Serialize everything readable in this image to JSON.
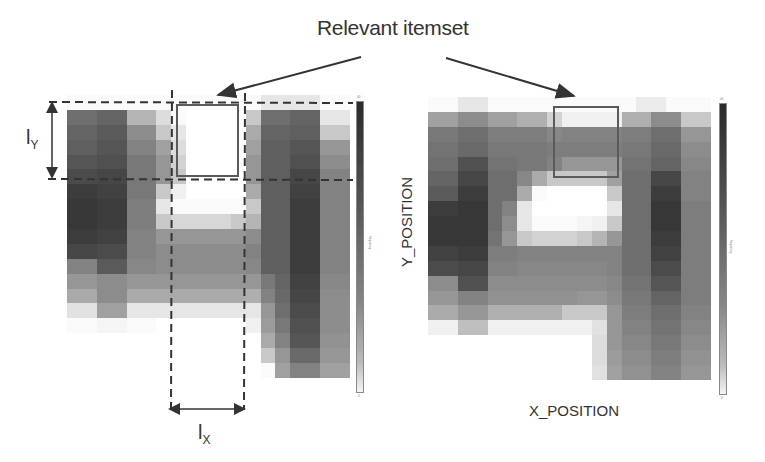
{
  "title": "Relevant itemset",
  "left_panel": {
    "ly_label": "l",
    "ly_sub": "Y",
    "lx_label": "l",
    "lx_sub": "X",
    "colorbar": {
      "top_tick": "40",
      "bottom_tick": "0",
      "label": "frequency"
    }
  },
  "right_panel": {
    "x_axis_label": "X_POSITION",
    "y_axis_label": "Y_POSITION",
    "colorbar": {
      "top_tick": "40",
      "bottom_tick": "0",
      "label": "frequency"
    }
  },
  "colors": {
    "box_border": "#5a5a5a",
    "dash": "#333333",
    "arrow": "#333333"
  },
  "chart_data": [
    {
      "type": "heatmap",
      "title": "Left heatmap with itemset window",
      "xlabel": "",
      "ylabel": "",
      "legend": "grayscale colorbar (dark = high frequency, light = low)",
      "origin": [
        67,
        95
      ],
      "cell_w": 14.9,
      "cell_h": 14.9,
      "grid": [
        [
          250,
          250,
          250,
          250,
          250,
          250,
          250,
          250,
          250,
          250,
          250,
          250,
          250,
          230,
          230,
          230,
          230,
          250,
          250
        ],
        [
          110,
          110,
          100,
          100,
          180,
          180,
          220,
          250,
          255,
          255,
          255,
          255,
          200,
          110,
          110,
          100,
          100,
          230,
          230
        ],
        [
          100,
          100,
          90,
          90,
          140,
          140,
          200,
          230,
          255,
          255,
          255,
          255,
          170,
          100,
          100,
          95,
          95,
          200,
          200
        ],
        [
          95,
          95,
          85,
          85,
          130,
          130,
          160,
          220,
          255,
          255,
          255,
          255,
          160,
          95,
          95,
          85,
          85,
          150,
          150
        ],
        [
          85,
          85,
          80,
          80,
          120,
          120,
          150,
          210,
          255,
          255,
          255,
          255,
          150,
          95,
          95,
          80,
          80,
          140,
          140
        ],
        [
          75,
          75,
          70,
          70,
          120,
          120,
          150,
          200,
          255,
          255,
          255,
          255,
          150,
          95,
          95,
          70,
          70,
          130,
          130
        ],
        [
          60,
          60,
          65,
          65,
          120,
          120,
          200,
          240,
          255,
          255,
          255,
          255,
          170,
          95,
          95,
          65,
          65,
          130,
          130
        ],
        [
          55,
          55,
          60,
          60,
          125,
          125,
          230,
          250,
          250,
          250,
          250,
          250,
          200,
          95,
          95,
          60,
          60,
          130,
          130
        ],
        [
          55,
          55,
          60,
          60,
          125,
          125,
          200,
          215,
          215,
          215,
          215,
          200,
          180,
          95,
          95,
          60,
          60,
          130,
          130
        ],
        [
          60,
          60,
          65,
          65,
          130,
          130,
          150,
          150,
          150,
          150,
          150,
          150,
          140,
          95,
          95,
          60,
          60,
          130,
          130
        ],
        [
          70,
          70,
          75,
          75,
          130,
          130,
          140,
          140,
          140,
          140,
          140,
          140,
          130,
          95,
          95,
          60,
          60,
          130,
          130
        ],
        [
          130,
          130,
          90,
          90,
          135,
          135,
          140,
          140,
          140,
          140,
          140,
          140,
          135,
          95,
          95,
          60,
          60,
          130,
          130
        ],
        [
          150,
          150,
          140,
          140,
          150,
          150,
          150,
          150,
          150,
          150,
          150,
          150,
          150,
          120,
          100,
          65,
          65,
          135,
          135
        ],
        [
          170,
          170,
          140,
          140,
          170,
          170,
          170,
          170,
          170,
          170,
          170,
          170,
          175,
          130,
          105,
          70,
          70,
          140,
          140
        ],
        [
          225,
          225,
          160,
          160,
          230,
          230,
          230,
          230,
          230,
          230,
          230,
          230,
          230,
          150,
          110,
          75,
          75,
          140,
          140
        ],
        [
          250,
          250,
          245,
          245,
          250,
          250,
          255,
          255,
          255,
          255,
          255,
          255,
          240,
          155,
          120,
          80,
          80,
          140,
          140
        ],
        [
          255,
          255,
          255,
          255,
          255,
          255,
          255,
          255,
          255,
          255,
          255,
          255,
          255,
          170,
          130,
          85,
          85,
          145,
          145
        ],
        [
          255,
          255,
          255,
          255,
          255,
          255,
          255,
          255,
          255,
          255,
          255,
          255,
          255,
          200,
          150,
          105,
          105,
          150,
          150
        ],
        [
          255,
          255,
          255,
          255,
          255,
          255,
          255,
          255,
          255,
          255,
          255,
          255,
          255,
          250,
          160,
          130,
          130,
          160,
          160
        ],
        [
          255,
          255,
          255,
          255,
          255,
          255,
          255,
          255,
          255,
          255,
          255,
          255,
          255,
          255,
          255,
          255,
          255,
          255,
          255
        ]
      ]
    },
    {
      "type": "heatmap",
      "title": "Right heatmap",
      "xlabel": "X_POSITION",
      "ylabel": "Y_POSITION",
      "legend": "grayscale colorbar (dark = high frequency, light = low)",
      "origin": [
        428,
        97
      ],
      "cell_w": 14.9,
      "cell_h": 14.9,
      "grid": [
        [
          250,
          250,
          230,
          230,
          250,
          250,
          250,
          250,
          250,
          250,
          250,
          250,
          250,
          250,
          235,
          235,
          250,
          250,
          250
        ],
        [
          160,
          160,
          140,
          140,
          160,
          160,
          175,
          175,
          210,
          240,
          240,
          240,
          240,
          175,
          175,
          140,
          140,
          200,
          200
        ],
        [
          120,
          120,
          110,
          110,
          125,
          125,
          125,
          125,
          135,
          130,
          130,
          130,
          130,
          125,
          125,
          110,
          110,
          150,
          150
        ],
        [
          115,
          115,
          105,
          105,
          120,
          120,
          120,
          120,
          125,
          125,
          125,
          125,
          125,
          120,
          120,
          105,
          105,
          140,
          140
        ],
        [
          110,
          110,
          80,
          80,
          115,
          115,
          120,
          120,
          130,
          150,
          150,
          150,
          150,
          115,
          115,
          100,
          100,
          135,
          135
        ],
        [
          100,
          100,
          70,
          70,
          110,
          110,
          135,
          170,
          200,
          200,
          200,
          200,
          160,
          110,
          110,
          70,
          70,
          130,
          130
        ],
        [
          90,
          90,
          60,
          60,
          110,
          110,
          170,
          250,
          255,
          255,
          255,
          255,
          200,
          110,
          110,
          60,
          60,
          130,
          130
        ],
        [
          60,
          60,
          55,
          55,
          110,
          130,
          230,
          255,
          255,
          255,
          255,
          255,
          230,
          110,
          110,
          55,
          55,
          125,
          125
        ],
        [
          55,
          55,
          55,
          55,
          110,
          140,
          230,
          250,
          250,
          250,
          245,
          240,
          200,
          110,
          110,
          55,
          55,
          125,
          125
        ],
        [
          55,
          55,
          55,
          55,
          115,
          150,
          200,
          210,
          210,
          210,
          200,
          180,
          150,
          110,
          110,
          60,
          60,
          125,
          125
        ],
        [
          65,
          65,
          60,
          60,
          125,
          125,
          130,
          130,
          130,
          130,
          130,
          130,
          130,
          110,
          110,
          65,
          65,
          125,
          125
        ],
        [
          75,
          75,
          70,
          70,
          130,
          130,
          135,
          135,
          135,
          135,
          135,
          135,
          130,
          110,
          110,
          75,
          75,
          125,
          125
        ],
        [
          140,
          140,
          80,
          80,
          140,
          140,
          140,
          140,
          140,
          140,
          140,
          140,
          135,
          115,
          115,
          85,
          85,
          125,
          125
        ],
        [
          150,
          150,
          130,
          130,
          145,
          145,
          145,
          145,
          145,
          145,
          150,
          150,
          140,
          120,
          120,
          100,
          100,
          125,
          125
        ],
        [
          170,
          170,
          150,
          150,
          175,
          175,
          175,
          175,
          175,
          200,
          200,
          200,
          150,
          125,
          125,
          110,
          110,
          130,
          130
        ],
        [
          240,
          240,
          190,
          190,
          240,
          240,
          240,
          240,
          240,
          240,
          240,
          225,
          150,
          130,
          130,
          115,
          115,
          135,
          135
        ],
        [
          255,
          255,
          255,
          255,
          255,
          255,
          255,
          255,
          255,
          255,
          255,
          220,
          150,
          135,
          135,
          120,
          120,
          140,
          140
        ],
        [
          255,
          255,
          255,
          255,
          255,
          255,
          255,
          255,
          255,
          255,
          255,
          220,
          155,
          140,
          140,
          125,
          125,
          145,
          145
        ],
        [
          255,
          255,
          255,
          255,
          255,
          255,
          255,
          255,
          255,
          255,
          255,
          225,
          160,
          145,
          145,
          130,
          130,
          150,
          150
        ],
        [
          255,
          255,
          255,
          255,
          255,
          255,
          255,
          255,
          255,
          255,
          255,
          255,
          255,
          255,
          255,
          255,
          255,
          255,
          255
        ]
      ]
    }
  ]
}
